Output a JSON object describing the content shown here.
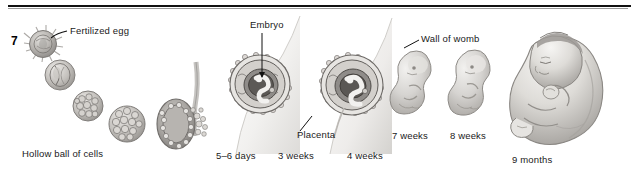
{
  "figure": {
    "page_marker": "7",
    "rule_color": "#111111",
    "background": "#ffffff",
    "ink_color": "#1a1a1a"
  },
  "labels": {
    "fertilized_egg": "Fertilized egg",
    "hollow_ball": "Hollow ball of cells",
    "days_5_6": "5–6 days",
    "embryo": "Embryo",
    "placenta": "Placenta",
    "weeks_3": "3 weeks",
    "weeks_4": "4 weeks",
    "wall_of_womb": "Wall of womb",
    "weeks_7": "7 weeks",
    "weeks_8": "8 weeks",
    "months_9": "9 months"
  },
  "stages": [
    {
      "name": "fertilized-egg",
      "label": "Fertilized egg",
      "caption": ""
    },
    {
      "name": "two-cell",
      "label": "",
      "caption": ""
    },
    {
      "name": "morula",
      "label": "Hollow ball of cells",
      "caption": ""
    },
    {
      "name": "blastocyst",
      "label": "",
      "caption": ""
    },
    {
      "name": "implanting-blastocyst",
      "label": "",
      "caption": "5–6 days"
    },
    {
      "name": "embryo-3-weeks",
      "label": "Embryo",
      "caption": "3 weeks"
    },
    {
      "name": "embryo-4-weeks",
      "label": "Placenta",
      "caption": "4 weeks"
    },
    {
      "name": "fetus-7-weeks",
      "label": "Wall of womb",
      "caption": "7 weeks"
    },
    {
      "name": "fetus-8-weeks",
      "label": "",
      "caption": "8 weeks"
    },
    {
      "name": "baby-9-months",
      "label": "",
      "caption": "9 months"
    }
  ]
}
